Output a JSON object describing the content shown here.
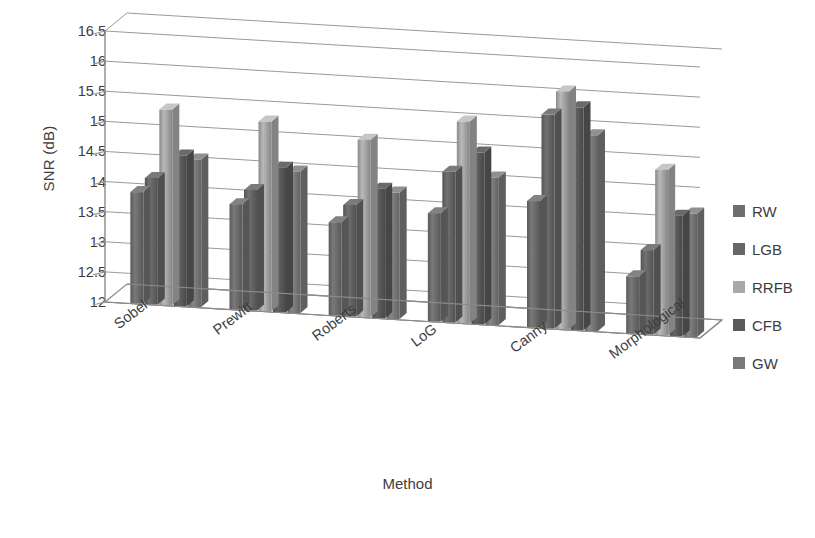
{
  "chart_data": {
    "type": "bar",
    "title": "",
    "subtitle": "",
    "xlabel": "Method",
    "ylabel": "SNR (dB)",
    "categories": [
      "Sobel",
      "Prewitt",
      "Roberts",
      "LoG",
      "Canny",
      "Morphological"
    ],
    "ylim": [
      12,
      16.5
    ],
    "yticks": [
      "12",
      "12.5",
      "13",
      "13.5",
      "14",
      "14.5",
      "15",
      "15.5",
      "16",
      "16.5"
    ],
    "ytick_values": [
      12,
      12.5,
      13,
      13.5,
      14,
      14.5,
      15,
      15.5,
      16,
      16.5
    ],
    "grid": true,
    "grid_axis": "y",
    "legend_position": "right",
    "three_d": true,
    "series": [
      {
        "name": "RW",
        "color": "#6e6e6e",
        "values": [
          13.85,
          13.75,
          13.55,
          13.8,
          14.1,
          12.95
        ]
      },
      {
        "name": "LGB",
        "color": "#676767",
        "values": [
          14.1,
          14.0,
          13.85,
          14.5,
          15.55,
          13.4
        ]
      },
      {
        "name": "RRFB",
        "color": "#a8a8a8",
        "values": [
          15.25,
          15.15,
          14.95,
          15.35,
          15.95,
          14.75
        ]
      },
      {
        "name": "CFB",
        "color": "#5a5a5a",
        "values": [
          14.5,
          14.4,
          14.15,
          14.85,
          15.7,
          14.0
        ]
      },
      {
        "name": "GW",
        "color": "#7a7a7a",
        "values": [
          14.45,
          14.35,
          14.1,
          14.45,
          15.25,
          14.05
        ]
      }
    ]
  },
  "axes": {
    "y_title": "SNR (dB)",
    "x_title": "Method"
  },
  "legend": {
    "items": [
      {
        "label": "RW",
        "color": "#6e6e6e"
      },
      {
        "label": "LGB",
        "color": "#676767"
      },
      {
        "label": "RRFB",
        "color": "#a8a8a8"
      },
      {
        "label": "CFB",
        "color": "#5a5a5a"
      },
      {
        "label": "GW",
        "color": "#7a7a7a"
      }
    ]
  },
  "colors": {
    "axis_line": "#8a8a8a",
    "grid_line": "#9a9a9a",
    "floor": "#ffffff",
    "text": "#3d3d3d",
    "background": "#ffffff"
  }
}
